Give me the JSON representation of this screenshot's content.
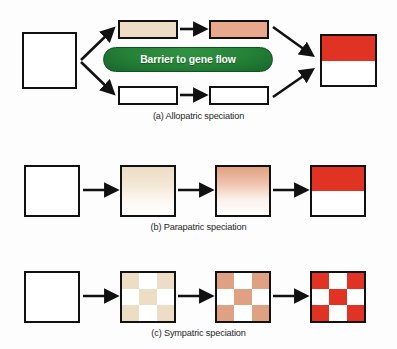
{
  "figure": {
    "background_color": "#fdfdfd",
    "outline_color": "#111111",
    "arrow_color": "#111111"
  },
  "palette": {
    "white": "#ffffff",
    "tan_light": "#ecddc4",
    "tan_pale": "#f2e7d4",
    "salmon": "#e8a88c",
    "salmon_light": "#eab79f",
    "red": "#e03323",
    "green_pill": "#248036",
    "green_pill_dark": "#17642a",
    "green_pill_light": "#2f9442"
  },
  "panels": [
    {
      "id": "allopatric",
      "caption": "(a) Allopatric speciation",
      "barrier_label": "Barrier to gene flow",
      "description": "One ancestral population splits; a barrier to gene flow separates two subpopulations that diverge and then form a two-species region.",
      "stages": [
        {
          "name": "ancestral-population",
          "shape": "square",
          "fill": "white"
        },
        {
          "name": "upper-isolate-early",
          "shape": "rectangle",
          "fill": "tan_light"
        },
        {
          "name": "upper-isolate-late",
          "shape": "rectangle",
          "fill": "salmon"
        },
        {
          "name": "lower-isolate-early",
          "shape": "rectangle",
          "fill": "white"
        },
        {
          "name": "lower-isolate-late",
          "shape": "rectangle",
          "fill": "white"
        },
        {
          "name": "resulting-species-pair",
          "shape": "square",
          "fill": "split-red-white"
        }
      ],
      "arrows": [
        "diverge-up",
        "diverge-down",
        "upper-progress",
        "lower-progress",
        "converge-from-upper",
        "converge-from-lower"
      ]
    },
    {
      "id": "parapatric",
      "caption": "(b) Parapatric speciation",
      "description": "A continuous population develops a gradual gradient of divergence across its range, sharpening into two adjoining species.",
      "stages": [
        {
          "name": "ancestral-population",
          "shape": "square",
          "fill": "white"
        },
        {
          "name": "gradient-early",
          "shape": "square",
          "fill": "gradient-tan"
        },
        {
          "name": "gradient-late",
          "shape": "square",
          "fill": "gradient-salmon"
        },
        {
          "name": "resulting-species-pair",
          "shape": "square",
          "fill": "split-red-white"
        }
      ],
      "arrows": [
        "step-1",
        "step-2",
        "step-3"
      ]
    },
    {
      "id": "sympatric",
      "caption": "(c) Sympatric speciation",
      "description": "Divergence arises within a single area, producing an interspersed mosaic of two species in the same range.",
      "stages": [
        {
          "name": "ancestral-population",
          "shape": "square",
          "fill": "white"
        },
        {
          "name": "mosaic-early",
          "shape": "square",
          "fill": "checker-tan"
        },
        {
          "name": "mosaic-late",
          "shape": "square",
          "fill": "checker-salmon"
        },
        {
          "name": "resulting-species-mosaic",
          "shape": "square",
          "fill": "checker-red"
        }
      ],
      "arrows": [
        "step-1",
        "step-2",
        "step-3"
      ]
    }
  ]
}
